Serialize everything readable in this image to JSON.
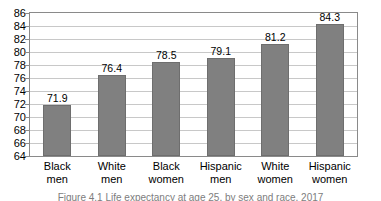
{
  "chart_data": {
    "type": "bar",
    "title": "",
    "subtitle": "",
    "xlabel": "",
    "ylabel": "",
    "ylim": [
      64,
      86
    ],
    "ytick_step": 2,
    "yticks": [
      86,
      84,
      82,
      80,
      78,
      76,
      74,
      72,
      70,
      68,
      66,
      64
    ],
    "grid": true,
    "legend": false,
    "legend_position": "none",
    "categories": [
      "Black men",
      "White men",
      "Black women",
      "Hispanic men",
      "White women",
      "Hispanic women"
    ],
    "category_lines": [
      [
        "Black",
        "men"
      ],
      [
        "White",
        "men"
      ],
      [
        "Black",
        "women"
      ],
      [
        "Hispanic",
        "men"
      ],
      [
        "White",
        "women"
      ],
      [
        "Hispanic",
        "women"
      ]
    ],
    "values": [
      71.9,
      76.4,
      78.5,
      79.1,
      81.2,
      84.3
    ],
    "value_labels": [
      "71.9",
      "76.4",
      "78.5",
      "79.1",
      "81.2",
      "84.3"
    ],
    "bar_color": "#808080",
    "bar_border_color": "#6e6e6e",
    "grid_color": "#c8c8c8",
    "frame_color": "#8a8a8a",
    "text_color": "#000000"
  },
  "caption": {
    "text": "Figure 4.1  Life expectancy at age 25, by sex and race, 2017"
  }
}
